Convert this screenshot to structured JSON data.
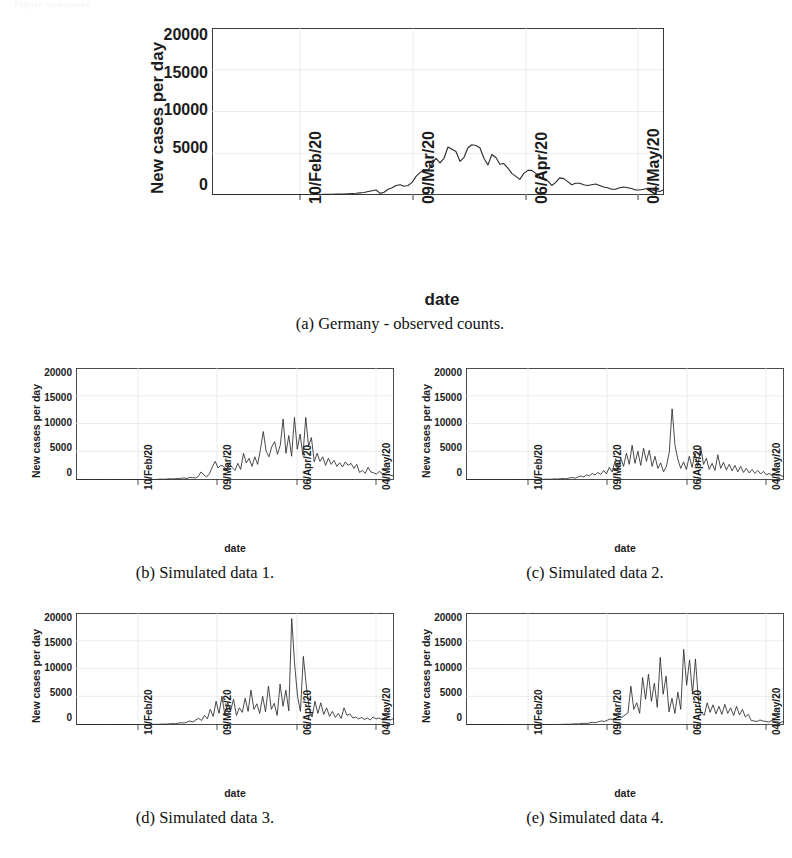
{
  "figure": {
    "top_artifact_text": "Figure continued",
    "axis": {
      "ylabel": "New cases per day",
      "xlabel": "date",
      "yticks": [
        "0",
        "5000",
        "10000",
        "15000",
        "20000"
      ],
      "ytick_values": [
        0,
        5000,
        10000,
        15000,
        20000
      ],
      "ylim": [
        0,
        22000
      ],
      "xticks": [
        "10/Feb/20",
        "09/Mar/20",
        "06/Apr/20",
        "04/May/20"
      ],
      "xtick_positions": [
        0.195,
        0.445,
        0.695,
        0.945
      ],
      "xlim": [
        "27/Jan/20",
        "18/May/20"
      ]
    },
    "panels": [
      {
        "key": "a",
        "caption": "(a) Germany - observed counts."
      },
      {
        "key": "b",
        "caption": "(b) Simulated data 1."
      },
      {
        "key": "c",
        "caption": "(c) Simulated data 2."
      },
      {
        "key": "d",
        "caption": "(d) Simulated data 3."
      },
      {
        "key": "e",
        "caption": "(e) Simulated data 4."
      }
    ]
  },
  "chart_data": [
    {
      "id": "a",
      "type": "line",
      "title": "Germany - observed counts",
      "xlabel": "date",
      "ylabel": "New cases per day",
      "ylim": [
        0,
        22000
      ],
      "grid": true,
      "legend": "none",
      "categories": [
        "27/Jan/20",
        "28/Jan/20",
        "29/Jan/20",
        "30/Jan/20",
        "31/Jan/20",
        "01/Feb/20",
        "02/Feb/20",
        "03/Feb/20",
        "04/Feb/20",
        "05/Feb/20",
        "06/Feb/20",
        "07/Feb/20",
        "08/Feb/20",
        "09/Feb/20",
        "10/Feb/20",
        "11/Feb/20",
        "12/Feb/20",
        "13/Feb/20",
        "14/Feb/20",
        "15/Feb/20",
        "16/Feb/20",
        "17/Feb/20",
        "18/Feb/20",
        "19/Feb/20",
        "20/Feb/20",
        "21/Feb/20",
        "22/Feb/20",
        "23/Feb/20",
        "24/Feb/20",
        "25/Feb/20",
        "26/Feb/20",
        "27/Feb/20",
        "28/Feb/20",
        "29/Feb/20",
        "01/Mar/20",
        "02/Mar/20",
        "03/Mar/20",
        "04/Mar/20",
        "05/Mar/20",
        "06/Mar/20",
        "07/Mar/20",
        "08/Mar/20",
        "09/Mar/20",
        "10/Mar/20",
        "11/Mar/20",
        "12/Mar/20",
        "13/Mar/20",
        "14/Mar/20",
        "15/Mar/20",
        "16/Mar/20",
        "17/Mar/20",
        "18/Mar/20",
        "19/Mar/20",
        "20/Mar/20",
        "21/Mar/20",
        "22/Mar/20",
        "23/Mar/20",
        "24/Mar/20",
        "25/Mar/20",
        "26/Mar/20",
        "27/Mar/20",
        "28/Mar/20",
        "29/Mar/20",
        "30/Mar/20",
        "31/Mar/20",
        "01/Apr/20",
        "02/Apr/20",
        "03/Apr/20",
        "04/Apr/20",
        "05/Apr/20",
        "06/Apr/20",
        "07/Apr/20",
        "08/Apr/20",
        "09/Apr/20",
        "10/Apr/20",
        "11/Apr/20",
        "12/Apr/20",
        "13/Apr/20",
        "14/Apr/20",
        "15/Apr/20",
        "16/Apr/20",
        "17/Apr/20",
        "18/Apr/20",
        "19/Apr/20",
        "20/Apr/20",
        "21/Apr/20",
        "22/Apr/20",
        "23/Apr/20",
        "24/Apr/20",
        "25/Apr/20",
        "26/Apr/20",
        "27/Apr/20",
        "28/Apr/20",
        "29/Apr/20",
        "30/Apr/20",
        "01/May/20",
        "02/May/20",
        "03/May/20",
        "04/May/20",
        "05/May/20",
        "06/May/20",
        "07/May/20",
        "08/May/20",
        "09/May/20",
        "10/May/20",
        "11/May/20",
        "12/May/20",
        "13/May/20",
        "14/May/20",
        "15/May/20",
        "16/May/20",
        "17/May/20",
        "18/May/20"
      ],
      "values": [
        1,
        0,
        4,
        0,
        0,
        1,
        2,
        0,
        0,
        1,
        0,
        1,
        0,
        2,
        1,
        0,
        0,
        0,
        0,
        0,
        0,
        0,
        0,
        0,
        0,
        1,
        2,
        5,
        13,
        20,
        25,
        50,
        60,
        70,
        100,
        130,
        160,
        220,
        270,
        400,
        500,
        600,
        150,
        300,
        700,
        900,
        1200,
        1300,
        1100,
        1200,
        1600,
        2400,
        2900,
        3300,
        3200,
        4000,
        4800,
        4200,
        4800,
        6300,
        6000,
        5700,
        4400,
        4900,
        6200,
        6600,
        6500,
        6200,
        4800,
        3900,
        5300,
        4900,
        4000,
        4100,
        3500,
        2800,
        2400,
        2000,
        2800,
        3200,
        3200,
        2800,
        2400,
        2000,
        1800,
        1200,
        1600,
        2200,
        2100,
        1700,
        1300,
        1500,
        1500,
        1300,
        1200,
        1300,
        1400,
        1200,
        1000,
        900,
        700,
        700,
        900,
        1000,
        900,
        800,
        600,
        600,
        700,
        800,
        600,
        500,
        400,
        600
      ]
    },
    {
      "id": "b",
      "type": "line",
      "title": "Simulated data 1",
      "xlabel": "date",
      "ylabel": "New cases per day",
      "ylim": [
        0,
        22000
      ],
      "grid": true,
      "legend": "none",
      "values": [
        0,
        0,
        0,
        0,
        0,
        0,
        0,
        0,
        0,
        0,
        0,
        0,
        0,
        0,
        0,
        0,
        0,
        0,
        0,
        0,
        0,
        0,
        0,
        0,
        0,
        0,
        0,
        0,
        0,
        50,
        80,
        40,
        100,
        150,
        100,
        200,
        180,
        250,
        300,
        200,
        400,
        350,
        300,
        600,
        1500,
        900,
        500,
        1200,
        2500,
        3600,
        2300,
        2800,
        2600,
        2000,
        3100,
        2400,
        1800,
        3200,
        2000,
        5200,
        3300,
        4200,
        2600,
        4500,
        3000,
        6000,
        9500,
        5600,
        4500,
        6500,
        7500,
        5000,
        6800,
        12000,
        5200,
        8700,
        4600,
        12300,
        6000,
        9000,
        4800,
        12300,
        6600,
        8300,
        3500,
        5200,
        3600,
        4500,
        2800,
        4200,
        3000,
        3800,
        2600,
        3300,
        2500,
        3500,
        2800,
        3200,
        2200,
        3000,
        1400,
        1800,
        1200,
        2400,
        1500,
        1300,
        1100,
        1600,
        1200,
        900,
        1000,
        800,
        700
      ]
    },
    {
      "id": "c",
      "type": "line",
      "title": "Simulated data 2",
      "xlabel": "date",
      "ylabel": "New cases per day",
      "ylim": [
        0,
        22000
      ],
      "grid": true,
      "legend": "none",
      "values": [
        0,
        0,
        0,
        0,
        0,
        0,
        0,
        0,
        0,
        0,
        0,
        0,
        0,
        0,
        0,
        0,
        0,
        0,
        0,
        0,
        0,
        0,
        0,
        0,
        0,
        0,
        0,
        30,
        60,
        40,
        90,
        120,
        100,
        160,
        200,
        150,
        300,
        400,
        250,
        500,
        700,
        500,
        900,
        700,
        1200,
        900,
        1400,
        1000,
        1800,
        1100,
        2400,
        1500,
        3600,
        2000,
        4300,
        2600,
        5200,
        3000,
        6800,
        3200,
        5600,
        2800,
        6200,
        3600,
        5800,
        2600,
        4600,
        2200,
        3300,
        1500,
        2600,
        5400,
        14000,
        6800,
        4000,
        2200,
        3500,
        2000,
        4600,
        2400,
        5200,
        2600,
        6400,
        3000,
        4200,
        2000,
        3200,
        1800,
        4900,
        2200,
        3400,
        1900,
        3000,
        1700,
        2800,
        1500,
        2600,
        1400,
        2200,
        1300,
        2000,
        1200,
        1800,
        1100,
        1600,
        900,
        1200,
        800,
        1000,
        700,
        800,
        600
      ]
    },
    {
      "id": "d",
      "type": "line",
      "title": "Simulated data 3",
      "xlabel": "date",
      "ylabel": "New cases per day",
      "ylim": [
        0,
        22000
      ],
      "grid": true,
      "legend": "none",
      "values": [
        0,
        0,
        0,
        0,
        0,
        0,
        0,
        0,
        0,
        0,
        0,
        0,
        0,
        0,
        0,
        0,
        0,
        0,
        0,
        0,
        0,
        0,
        0,
        0,
        0,
        0,
        20,
        40,
        30,
        70,
        100,
        80,
        140,
        180,
        150,
        260,
        350,
        280,
        480,
        700,
        500,
        900,
        1200,
        800,
        1800,
        1100,
        3000,
        1600,
        4600,
        2200,
        5600,
        2000,
        4300,
        2800,
        5000,
        1800,
        3300,
        2400,
        5200,
        2600,
        6800,
        3000,
        4100,
        2200,
        5600,
        2500,
        7600,
        3000,
        4200,
        1800,
        8000,
        3600,
        6800,
        2700,
        21000,
        12000,
        5600,
        2600,
        13500,
        7800,
        3200,
        1500,
        4600,
        2200,
        4300,
        2000,
        3300,
        1600,
        2600,
        1400,
        2200,
        1200,
        3300,
        1800,
        2100,
        1300,
        1500,
        1100,
        1400,
        1000,
        1300,
        900,
        1500,
        1100,
        1300,
        950,
        1400,
        1000,
        900,
        1200
      ]
    },
    {
      "id": "e",
      "type": "line",
      "title": "Simulated data 4",
      "xlabel": "date",
      "ylabel": "New cases per day",
      "ylim": [
        0,
        22000
      ],
      "grid": true,
      "legend": "none",
      "values": [
        0,
        0,
        0,
        0,
        0,
        0,
        0,
        0,
        0,
        0,
        0,
        0,
        0,
        0,
        0,
        0,
        0,
        0,
        0,
        0,
        0,
        0,
        0,
        0,
        0,
        0,
        0,
        0,
        0,
        0,
        0,
        0,
        20,
        40,
        60,
        50,
        90,
        130,
        100,
        180,
        250,
        200,
        330,
        420,
        350,
        560,
        700,
        600,
        850,
        1100,
        900,
        1300,
        1600,
        1400,
        1900,
        2300,
        7600,
        3000,
        4300,
        2200,
        9300,
        5000,
        10000,
        4600,
        8200,
        3400,
        13300,
        6000,
        9600,
        2500,
        5200,
        2200,
        6400,
        3000,
        14900,
        7800,
        12800,
        6000,
        13000,
        4800,
        2300,
        1800,
        4300,
        2400,
        3900,
        2100,
        3600,
        2000,
        4000,
        2200,
        3300,
        1800,
        3600,
        1900,
        3000,
        1500,
        2000,
        800,
        700,
        600,
        900,
        700,
        600,
        500,
        800,
        600,
        500,
        400,
        600
      ]
    }
  ]
}
